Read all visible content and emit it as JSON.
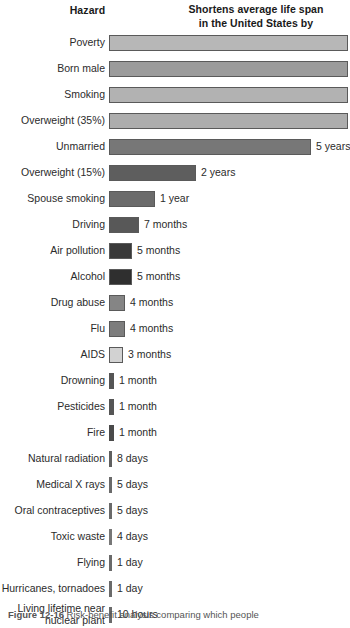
{
  "header": {
    "left_title": "Hazard",
    "right_title_line1": "Shortens average life span",
    "right_title_line2": "in the United States by"
  },
  "caption": {
    "figure_number": "Figure 12-16",
    "text": "Risk-benefit analysis comparing which people"
  },
  "chart_data": {
    "type": "bar",
    "title": "Shortens average life span in the United States by",
    "xlabel": "Shortens average life span in the United States by",
    "ylabel": "Hazard",
    "orientation": "horizontal",
    "grid": false,
    "legend": false,
    "categories": [
      "Poverty",
      "Born male",
      "Smoking",
      "Overweight (35%)",
      "Unmarried",
      "Overweight (15%)",
      "Spouse smoking",
      "Driving",
      "Air pollution",
      "Alcohol",
      "Drug abuse",
      "Flu",
      "AIDS",
      "Drowning",
      "Pesticides",
      "Fire",
      "Natural radiation",
      "Medical X rays",
      "Oral contraceptives",
      "Toxic waste",
      "Flying",
      "Hurricanes, tornadoes",
      "Living lifetime near nuclear plant"
    ],
    "value_labels": [
      "",
      "",
      "",
      "",
      "5 years",
      "2 years",
      "1 year",
      "7 months",
      "5 months",
      "5 months",
      "4 months",
      "4 months",
      "3 months",
      "1 month",
      "1 month",
      "1 month",
      "8 days",
      "5 days",
      "5 days",
      "4 days",
      "1 day",
      "1 day",
      "10 hours"
    ],
    "values_days": [
      3650,
      2920,
      2190,
      1095,
      1825,
      730,
      365,
      213,
      152,
      152,
      122,
      122,
      91,
      30,
      30,
      30,
      8,
      5,
      5,
      4,
      1,
      1,
      0.42
    ],
    "units": "days of life span lost"
  },
  "rows": [
    {
      "label": "Poverty",
      "value": "",
      "bar_px": 239,
      "height_px": 16,
      "color": "#b7b7b7",
      "clipped": true
    },
    {
      "label": "Born male",
      "value": "",
      "bar_px": 239,
      "height_px": 16,
      "color": "#9b9b9b",
      "clipped": true
    },
    {
      "label": "Smoking",
      "value": "",
      "bar_px": 239,
      "height_px": 16,
      "color": "#b2b2b2",
      "clipped": true
    },
    {
      "label": "Overweight (35%)",
      "value": "",
      "bar_px": 239,
      "height_px": 16,
      "color": "#adadad",
      "clipped": true
    },
    {
      "label": "Unmarried",
      "value": "5 years",
      "bar_px": 202,
      "height_px": 16,
      "color": "#777777",
      "clipped": false
    },
    {
      "label": "Overweight (15%)",
      "value": "2 years",
      "bar_px": 87,
      "height_px": 16,
      "color": "#5e5e5e",
      "clipped": false
    },
    {
      "label": "Spouse smoking",
      "value": "1 year",
      "bar_px": 46,
      "height_px": 16,
      "color": "#6b6b6b",
      "clipped": false
    },
    {
      "label": "Driving",
      "value": "7 months",
      "bar_px": 30,
      "height_px": 16,
      "color": "#585858",
      "clipped": false
    },
    {
      "label": "Air pollution",
      "value": "5 months",
      "bar_px": 23,
      "height_px": 16,
      "color": "#3a3a3a",
      "clipped": false
    },
    {
      "label": "Alcohol",
      "value": "5 months",
      "bar_px": 23,
      "height_px": 16,
      "color": "#2f2f2f",
      "clipped": false
    },
    {
      "label": "Drug abuse",
      "value": "4 months",
      "bar_px": 16,
      "height_px": 16,
      "color": "#858585",
      "clipped": false
    },
    {
      "label": "Flu",
      "value": "4 months",
      "bar_px": 16,
      "height_px": 16,
      "color": "#7d7d7d",
      "clipped": false
    },
    {
      "label": "AIDS",
      "value": "3 months",
      "bar_px": 14,
      "height_px": 16,
      "color": "#d2d2d2",
      "clipped": false
    },
    {
      "label": "Drowning",
      "value": "1 month",
      "bar_px": 5,
      "height_px": 16,
      "color": "#555555",
      "clipped": false
    },
    {
      "label": "Pesticides",
      "value": "1 month",
      "bar_px": 5,
      "height_px": 16,
      "color": "#555555",
      "clipped": false
    },
    {
      "label": "Fire",
      "value": "1 month",
      "bar_px": 5,
      "height_px": 16,
      "color": "#4a4a4a",
      "clipped": false
    },
    {
      "label": "Natural radiation",
      "value": "8 days",
      "bar_px": 3,
      "height_px": 16,
      "color": "#5f5f5f",
      "clipped": false
    },
    {
      "label": "Medical X rays",
      "value": "5 days",
      "bar_px": 3,
      "height_px": 16,
      "color": "#6a6a6a",
      "clipped": false
    },
    {
      "label": "Oral contraceptives",
      "value": "5 days",
      "bar_px": 3,
      "height_px": 16,
      "color": "#6a6a6a",
      "clipped": false
    },
    {
      "label": "Toxic waste",
      "value": "4 days",
      "bar_px": 3,
      "height_px": 16,
      "color": "#777777",
      "clipped": false
    },
    {
      "label": "Flying",
      "value": "1 day",
      "bar_px": 3,
      "height_px": 16,
      "color": "#6a6a6a",
      "clipped": false
    },
    {
      "label": "Hurricanes, tornadoes",
      "value": "1 day",
      "bar_px": 3,
      "height_px": 16,
      "color": "#6a6a6a",
      "clipped": false
    },
    {
      "label": "Living lifetime near\nnuclear plant",
      "value": "10 hours",
      "bar_px": 3,
      "height_px": 16,
      "color": "#6a6a6a",
      "clipped": false
    }
  ]
}
